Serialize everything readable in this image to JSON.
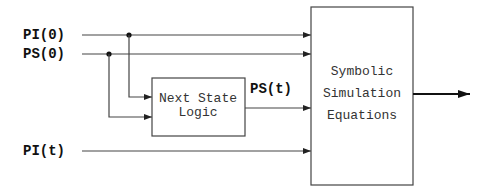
{
  "diagram": {
    "inputs": {
      "pi0": "PI(0)",
      "ps0": "PS(0)",
      "pit": "PI(t)"
    },
    "intermediate": {
      "pst": "PS(t)"
    },
    "next_state_logic": {
      "line1": "Next State",
      "line2": "Logic"
    },
    "symbolic_simulation": {
      "line1": "Symbolic",
      "line2": "Simulation",
      "line3": "Equations"
    },
    "colors": {
      "line": "#444444",
      "text": "#111111",
      "background": "#ffffff"
    }
  }
}
